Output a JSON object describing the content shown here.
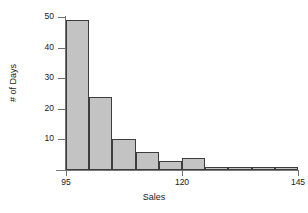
{
  "chart_data": {
    "type": "bar",
    "title": "",
    "subtitle": "",
    "xlabel": "Sales",
    "ylabel": "# of Days",
    "orientation": "vertical",
    "grid": false,
    "legend": null,
    "legend_position": "none",
    "histogram": true,
    "bin_width": 5,
    "bin_edges": [
      95,
      100,
      105,
      110,
      115,
      120,
      125,
      130,
      135,
      140,
      145
    ],
    "categories": [
      "95-100",
      "100-105",
      "105-110",
      "110-115",
      "115-120",
      "120-125",
      "125-130",
      "130-135",
      "135-140",
      "140-145"
    ],
    "values": [
      49,
      24,
      10,
      6,
      3,
      4,
      1,
      1,
      1,
      1
    ],
    "x": [
      97.5,
      102.5,
      107.5,
      112.5,
      117.5,
      122.5,
      127.5,
      132.5,
      137.5,
      142.5
    ],
    "xlim": [
      95,
      145
    ],
    "ylim": [
      0,
      51
    ],
    "xticks": [
      95,
      120,
      145
    ],
    "xtick_labels": [
      "95",
      "120",
      "145"
    ],
    "yticks": [
      10,
      20,
      30,
      40,
      50
    ],
    "ytick_labels": [
      "10",
      "20",
      "30",
      "40",
      "50"
    ],
    "bar_fill_color": "#c3c3c3",
    "bar_edge_color": "#3d3d3d",
    "axis_color": "#6f6f6f",
    "text_color": "#1a1a1a",
    "background_color": "#ffffff",
    "annotations": []
  }
}
